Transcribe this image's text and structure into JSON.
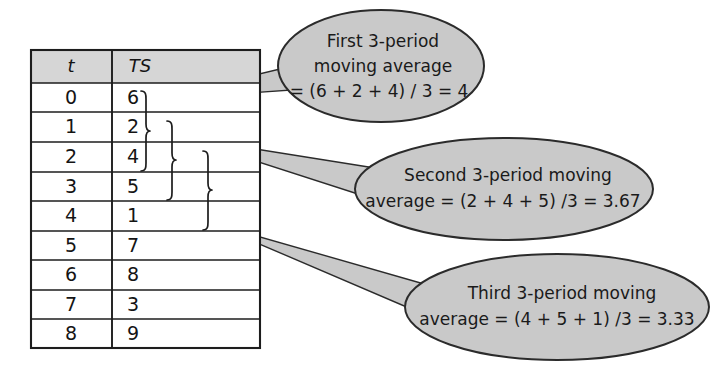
{
  "figure": {
    "kind": "moving-average-illustration",
    "colors": {
      "bubble_fill": "#c9c9c9",
      "bubble_stroke": "#2b2b2b",
      "table_header_fill": "#d6d6d6",
      "table_body_fill": "#ffffff",
      "table_border": "#1d1d1d",
      "text": "#141414",
      "tail_fill": "#c9c9c9",
      "page_background": "#ffffff"
    }
  },
  "table": {
    "headers": [
      "t",
      "TS"
    ],
    "rows": [
      {
        "t": "0",
        "ts": "6"
      },
      {
        "t": "1",
        "ts": "2"
      },
      {
        "t": "2",
        "ts": "4"
      },
      {
        "t": "3",
        "ts": "5"
      },
      {
        "t": "4",
        "ts": "1"
      },
      {
        "t": "5",
        "ts": "7"
      },
      {
        "t": "6",
        "ts": "8"
      },
      {
        "t": "7",
        "ts": "3"
      },
      {
        "t": "8",
        "ts": "9"
      }
    ]
  },
  "braces": [
    {
      "label": "brace-window-1",
      "covers": [
        "6",
        "2",
        "4"
      ]
    },
    {
      "label": "brace-window-2",
      "covers": [
        "2",
        "4",
        "5"
      ]
    },
    {
      "label": "brace-window-3",
      "covers": [
        "4",
        "5",
        "1"
      ]
    }
  ],
  "callouts": [
    {
      "id": "first",
      "lines": [
        "First 3-period",
        "moving average",
        "= (6 + 2 + 4) / 3 = 4"
      ]
    },
    {
      "id": "second",
      "lines": [
        "Second 3-period moving",
        "average = (2 + 4 + 5) /3 = 3.67"
      ]
    },
    {
      "id": "third",
      "lines": [
        "Third 3-period moving",
        "average = (4 + 5 + 1) /3 = 3.33"
      ]
    }
  ]
}
